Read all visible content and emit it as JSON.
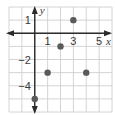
{
  "chart_data": {
    "type": "scatter",
    "title": "",
    "xlabel": "x",
    "ylabel": "y",
    "xlim": [
      -2,
      6
    ],
    "ylim": [
      -6,
      2
    ],
    "grid": true,
    "x_ticks": [
      {
        "value": 1,
        "label": "1"
      },
      {
        "value": 3,
        "label": "3"
      },
      {
        "value": 5,
        "label": "5"
      }
    ],
    "y_ticks": [
      {
        "value": 1,
        "label": "1"
      },
      {
        "value": -2,
        "label": "−2"
      },
      {
        "value": -4,
        "label": "−4"
      }
    ],
    "series": [
      {
        "name": "points",
        "points": [
          {
            "x": 3,
            "y": 1
          },
          {
            "x": 2,
            "y": -1
          },
          {
            "x": 1,
            "y": -3
          },
          {
            "x": 4,
            "y": -3
          },
          {
            "x": 0,
            "y": -5
          }
        ]
      }
    ],
    "colors": {
      "grid": "#cfcfcf",
      "axis": "#2b2b2b",
      "point": "#5a5a5a",
      "text": "#3a3a3a"
    }
  }
}
